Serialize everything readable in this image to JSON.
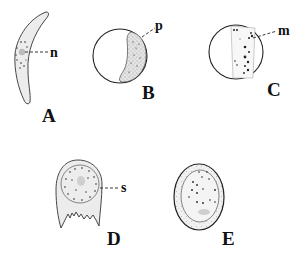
{
  "figure": {
    "panels": [
      {
        "id": "A",
        "label": "A",
        "shape": "crescent cell",
        "part_label": "n",
        "part_meaning": "nucleus"
      },
      {
        "id": "B",
        "label": "B",
        "shape": "spherical cell with crescent plastid",
        "part_label": "p"
      },
      {
        "id": "C",
        "label": "C",
        "shape": "spherical cell with band of granules",
        "part_label": "m"
      },
      {
        "id": "D",
        "label": "D",
        "shape": "cup-shaped cell with fringed base",
        "part_label": "s"
      },
      {
        "id": "E",
        "label": "E",
        "shape": "oval cyst with granules",
        "part_label": ""
      }
    ]
  }
}
